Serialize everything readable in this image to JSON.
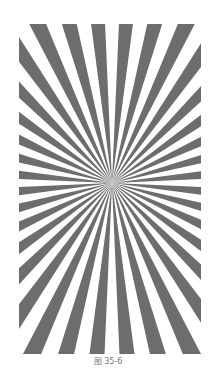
{
  "figure": {
    "type": "siemens-star",
    "sectors": 36,
    "color_dark": "#6d6d6d",
    "color_light": "#ffffff",
    "caption": "图 35-6"
  }
}
